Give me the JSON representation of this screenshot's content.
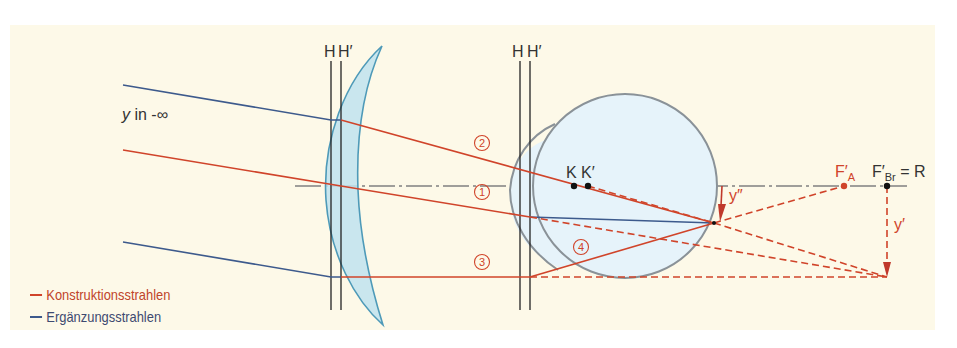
{
  "diagram": {
    "type": "optical ray construction",
    "colors": {
      "background": "#fdf9e8",
      "construction_ray": "#d0442a",
      "supplementary_ray": "#3d5a8c",
      "lens_fill": "#bfe3ee",
      "lens_stroke": "#4e9ab8",
      "eye_fill": "#e6f3fa",
      "eye_stroke": "#8a9298",
      "principal_plane": "#222222",
      "axis": "#777777"
    },
    "labels": {
      "object": "y in -∞",
      "object_y": "y",
      "object_rest": " in -∞",
      "lens_H": "H",
      "lens_H_prime": "H′",
      "eye_H": "H",
      "eye_H_prime": "H′",
      "K": "K",
      "K_prime": "K′",
      "FA_main": "F′",
      "FA_sub": "A",
      "FBr_main": "F′",
      "FBr_sub": "Br",
      "FBr_rest": " = R",
      "image_y2": "y″",
      "image_y1": "y′"
    },
    "ray_numbers": [
      "2",
      "1",
      "3",
      "4"
    ],
    "legend": [
      {
        "label": "Konstruktionsstrahlen",
        "color": "#d0442a"
      },
      {
        "label": "Ergänzungsstrahlen",
        "color": "#3d5a8c"
      }
    ]
  }
}
